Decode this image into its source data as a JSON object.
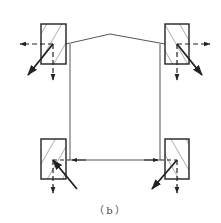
{
  "diagram": {
    "caption": "（b）",
    "colors": {
      "line": "#222222",
      "thin_line": "#555555",
      "background": "#ffffff"
    },
    "nodes": [
      {
        "id": "top-left-column",
        "hatch": "forward"
      },
      {
        "id": "top-right-column",
        "hatch": "backward"
      },
      {
        "id": "bottom-left-column",
        "hatch": "forward"
      },
      {
        "id": "bottom-right-column",
        "hatch": "backward"
      }
    ],
    "members": [
      {
        "id": "roof-left",
        "type": "rafter"
      },
      {
        "id": "roof-right",
        "type": "rafter"
      },
      {
        "id": "left-side-wall",
        "type": "vertical"
      },
      {
        "id": "right-side-wall",
        "type": "vertical"
      },
      {
        "id": "bottom-tie",
        "type": "horizontal",
        "arrows": "both-inward"
      }
    ]
  }
}
